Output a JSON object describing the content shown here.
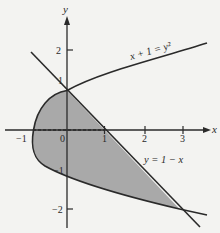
{
  "figure": {
    "axes": {
      "x_label": "x",
      "y_label": "y",
      "x_ticks": [
        {
          "value": -1,
          "label": "−1"
        },
        {
          "value": 0,
          "label": "0"
        },
        {
          "value": 1,
          "label": "1"
        },
        {
          "value": 2,
          "label": "2"
        },
        {
          "value": 3,
          "label": "3"
        }
      ],
      "y_ticks": [
        {
          "value": 2,
          "label": "2"
        },
        {
          "value": 1,
          "label": "1"
        },
        {
          "value": -1,
          "label": "−1"
        },
        {
          "value": -2,
          "label": "−2"
        }
      ]
    },
    "curves": [
      {
        "name": "parabola",
        "equation_label": "x + 1 = y²"
      },
      {
        "name": "line",
        "equation_label": "y = 1 − x"
      }
    ],
    "intersections": [
      {
        "x": 0,
        "y": 1
      },
      {
        "x": 3,
        "y": -2
      }
    ],
    "shaded_region": {
      "description": "Region bounded by x = y² − 1 and y = 1 − x for −2 ≤ y ≤ 1",
      "fill_color": "#a9a9a9"
    },
    "colors": {
      "background": "#f3f3f1",
      "curve": "#2a2a2a",
      "shade": "#a9a9a9"
    }
  }
}
